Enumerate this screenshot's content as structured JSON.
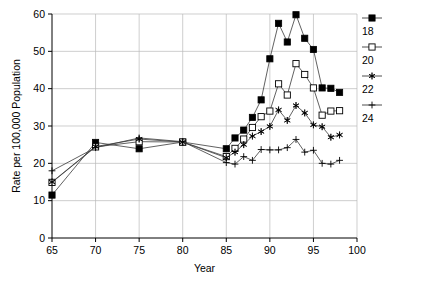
{
  "chart_data": {
    "type": "line",
    "title": "",
    "xlabel": "Year",
    "ylabel": "Rate per 100,000 Population",
    "xlim": [
      65,
      100
    ],
    "ylim": [
      0,
      60
    ],
    "xticks": [
      65,
      70,
      75,
      80,
      85,
      90,
      95,
      100
    ],
    "yticks": [
      0,
      10,
      20,
      30,
      40,
      50,
      60
    ],
    "grid": true,
    "legend_position": "right",
    "series": [
      {
        "name": "18",
        "marker": "filled-square",
        "x": [
          65,
          70,
          75,
          80,
          85,
          86,
          87,
          88,
          89,
          90,
          91,
          92,
          93,
          94,
          95,
          96,
          97,
          98
        ],
        "values": [
          11.5,
          25.6,
          23.9,
          25.7,
          23.9,
          26.8,
          28.9,
          32.3,
          37.0,
          48.0,
          57.5,
          52.5,
          59.8,
          53.5,
          50.5,
          40.2,
          40.1,
          39.0
        ]
      },
      {
        "name": "20",
        "marker": "open-square",
        "x": [
          65,
          70,
          75,
          80,
          85,
          86,
          87,
          88,
          89,
          90,
          91,
          92,
          93,
          94,
          95,
          96,
          97,
          98
        ],
        "values": [
          14.9,
          24.4,
          25.8,
          25.7,
          21.8,
          24.0,
          26.5,
          29.6,
          32.5,
          34.0,
          41.3,
          38.3,
          46.7,
          43.8,
          40.2,
          32.9,
          34.0,
          34.1
        ]
      },
      {
        "name": "22",
        "marker": "asterisk",
        "x": [
          65,
          70,
          75,
          80,
          85,
          86,
          87,
          88,
          89,
          90,
          91,
          92,
          93,
          94,
          95,
          96,
          97,
          98
        ],
        "values": [
          15.0,
          24.5,
          26.5,
          25.7,
          21.5,
          23.0,
          25.0,
          27.3,
          28.5,
          29.9,
          34.3,
          31.5,
          35.5,
          33.5,
          30.3,
          29.8,
          27.0,
          27.6
        ]
      },
      {
        "name": "24",
        "marker": "plus",
        "x": [
          65,
          70,
          75,
          80,
          85,
          86,
          87,
          88,
          89,
          90,
          91,
          92,
          93,
          94,
          95,
          96,
          97,
          98
        ],
        "values": [
          18.0,
          24.2,
          26.8,
          25.8,
          20.2,
          19.8,
          21.8,
          20.8,
          23.7,
          23.6,
          23.6,
          24.2,
          26.4,
          23.0,
          23.5,
          20.0,
          19.8,
          20.8
        ]
      }
    ],
    "legend": [
      {
        "label": "18",
        "marker": "filled-square"
      },
      {
        "label": "20",
        "marker": "open-square"
      },
      {
        "label": "22",
        "marker": "asterisk"
      },
      {
        "label": "24",
        "marker": "plus"
      }
    ]
  }
}
